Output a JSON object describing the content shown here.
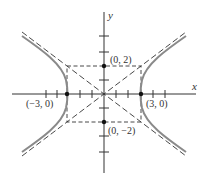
{
  "diagram": {
    "type": "hyperbola",
    "equation_params": {
      "a": 3,
      "b": 2,
      "orientation": "horizontal"
    },
    "axes": {
      "x_label": "x",
      "y_label": "y"
    },
    "points": [
      {
        "label": "(0, 2)",
        "x": 0,
        "y": 2
      },
      {
        "label": "(0, −2)",
        "x": 0,
        "y": -2
      },
      {
        "label": "(−3, 0)",
        "x": -3,
        "y": 0
      },
      {
        "label": "(3, 0)",
        "x": 3,
        "y": 0
      }
    ],
    "asymptotes": [
      "y = 2x/3",
      "y = -2x/3"
    ],
    "colors": {
      "curve": "#8a8a8a",
      "lines": "#333333"
    }
  }
}
